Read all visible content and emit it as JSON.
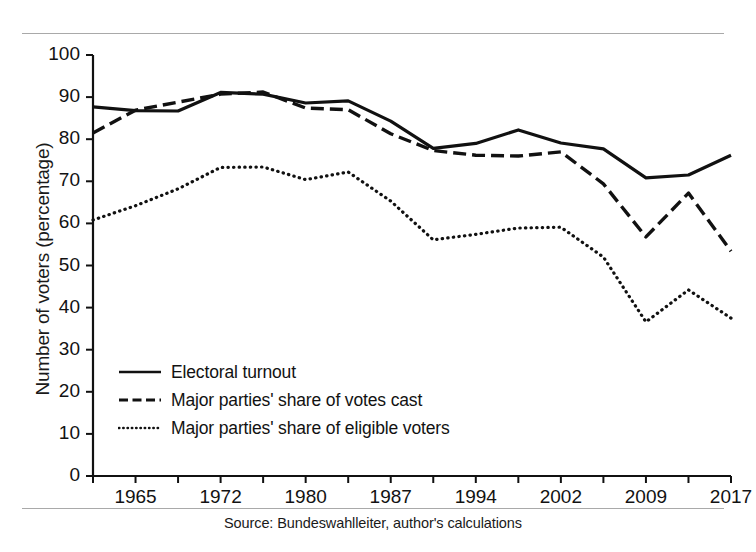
{
  "chart_data": {
    "type": "line",
    "title": "",
    "xlabel": "",
    "ylabel": "Number of voters (percentage)",
    "ylim": [
      0,
      100
    ],
    "yticks": [
      0,
      10,
      20,
      30,
      40,
      50,
      60,
      70,
      80,
      90,
      100
    ],
    "grid": false,
    "legend_position": "inside-lower-left",
    "x": [
      1961,
      1965,
      1969,
      1972,
      1976,
      1980,
      1983,
      1987,
      1990,
      1994,
      1998,
      2002,
      2005,
      2009,
      2013,
      2017
    ],
    "xtick_labels": [
      "1965",
      "1972",
      "1980",
      "1987",
      "1994",
      "2002",
      "2009",
      "2017"
    ],
    "xtick_values": [
      1965,
      1972,
      1980,
      1987,
      1994,
      2002,
      2009,
      2017
    ],
    "series": [
      {
        "name": "Electoral turnout",
        "style": "solid",
        "color": "#111111",
        "values": [
          87.7,
          86.8,
          86.7,
          91.1,
          90.7,
          88.6,
          89.1,
          84.3,
          77.8,
          79.0,
          82.2,
          79.1,
          77.7,
          70.8,
          71.5,
          76.2
        ]
      },
      {
        "name": "Major parties' share of votes cast",
        "style": "dashed",
        "color": "#111111",
        "values": [
          81.5,
          86.9,
          88.8,
          90.7,
          91.2,
          87.4,
          87.0,
          81.3,
          77.3,
          76.2,
          76.0,
          77.0,
          69.4,
          56.8,
          67.2,
          53.4
        ]
      },
      {
        "name": "Major parties' share of eligible voters",
        "style": "dotted",
        "color": "#111111",
        "values": [
          60.8,
          64.2,
          68.2,
          73.3,
          73.4,
          70.4,
          72.2,
          65.3,
          56.1,
          57.4,
          58.9,
          59.1,
          52.0,
          36.6,
          44.2,
          37.5
        ]
      }
    ]
  },
  "axis": {
    "y_title": "Number of voters (percentage)",
    "y_tick_labels": [
      "100",
      "90",
      "80",
      "70",
      "60",
      "50",
      "40",
      "30",
      "20",
      "10",
      "0"
    ],
    "x_tick_labels": [
      "1965",
      "1972",
      "1980",
      "1987",
      "1994",
      "2002",
      "2009",
      "2017"
    ]
  },
  "legend": {
    "items": [
      {
        "label": "Electoral turnout",
        "style": "solid"
      },
      {
        "label": "Major parties' share of votes cast",
        "style": "dashed"
      },
      {
        "label": "Major parties' share of eligible voters",
        "style": "dotted"
      }
    ]
  },
  "source": {
    "text": "Source: Bundeswahlleiter, author's calculations"
  },
  "colors": {
    "ink": "#111111",
    "rule": "#9a9a9a",
    "background": "#ffffff"
  }
}
